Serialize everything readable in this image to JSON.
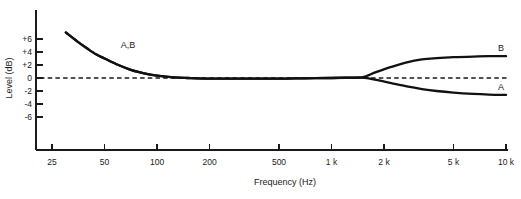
{
  "chart_data": {
    "type": "line",
    "title": "",
    "xlabel": "Frequency (Hz)",
    "ylabel": "Level (dB)",
    "xscale": "log",
    "xlim": [
      25,
      10000
    ],
    "ylim": [
      -7,
      7.5
    ],
    "grid": false,
    "legend": "inline-annotations",
    "xticks": [
      {
        "value": 25,
        "label": "25"
      },
      {
        "value": 50,
        "label": "50"
      },
      {
        "value": 100,
        "label": "100"
      },
      {
        "value": 200,
        "label": "200"
      },
      {
        "value": 500,
        "label": "500"
      },
      {
        "value": 1000,
        "label": "1 k"
      },
      {
        "value": 2000,
        "label": "2 k"
      },
      {
        "value": 5000,
        "label": "5 k"
      },
      {
        "value": 10000,
        "label": "10 k"
      }
    ],
    "yticks": [
      {
        "value": 6,
        "label": "+6"
      },
      {
        "value": 4,
        "label": "+4"
      },
      {
        "value": 2,
        "label": "+2"
      },
      {
        "value": 0,
        "label": "0"
      },
      {
        "value": -2,
        "label": "-2"
      },
      {
        "value": -4,
        "label": "-4"
      },
      {
        "value": -6,
        "label": "-6"
      }
    ],
    "reference_line": {
      "value": 0,
      "style": "dashed",
      "label": "0 dB reference"
    },
    "annotations": [
      {
        "text": "A,B",
        "x": 62,
        "y": 4.6,
        "note": "shared low-frequency boost region"
      },
      {
        "text": "B",
        "x": 9000,
        "y": 4.1,
        "note": "curve B high-frequency boost"
      },
      {
        "text": "A",
        "x": 9000,
        "y": -1.9,
        "note": "curve A high-frequency cut"
      }
    ],
    "series": [
      {
        "name": "A",
        "points": [
          [
            30,
            7.0
          ],
          [
            35,
            5.6
          ],
          [
            40,
            4.5
          ],
          [
            45,
            3.6
          ],
          [
            50,
            3.0
          ],
          [
            60,
            2.0
          ],
          [
            70,
            1.3
          ],
          [
            80,
            0.85
          ],
          [
            90,
            0.55
          ],
          [
            100,
            0.35
          ],
          [
            125,
            0.1
          ],
          [
            150,
            0.0
          ],
          [
            200,
            -0.1
          ],
          [
            300,
            -0.1
          ],
          [
            500,
            -0.1
          ],
          [
            700,
            -0.05
          ],
          [
            1000,
            0.0
          ],
          [
            1250,
            0.05
          ],
          [
            1500,
            0.05
          ],
          [
            1800,
            -0.3
          ],
          [
            2200,
            -0.8
          ],
          [
            2700,
            -1.3
          ],
          [
            3300,
            -1.7
          ],
          [
            4000,
            -2.0
          ],
          [
            5000,
            -2.25
          ],
          [
            6500,
            -2.45
          ],
          [
            8000,
            -2.55
          ],
          [
            10000,
            -2.6
          ]
        ]
      },
      {
        "name": "B",
        "points": [
          [
            30,
            7.0
          ],
          [
            35,
            5.6
          ],
          [
            40,
            4.5
          ],
          [
            45,
            3.6
          ],
          [
            50,
            3.0
          ],
          [
            60,
            2.0
          ],
          [
            70,
            1.3
          ],
          [
            80,
            0.85
          ],
          [
            90,
            0.55
          ],
          [
            100,
            0.35
          ],
          [
            125,
            0.1
          ],
          [
            150,
            0.0
          ],
          [
            200,
            -0.1
          ],
          [
            300,
            -0.1
          ],
          [
            500,
            -0.1
          ],
          [
            700,
            -0.05
          ],
          [
            1000,
            0.0
          ],
          [
            1250,
            0.05
          ],
          [
            1500,
            0.1
          ],
          [
            1800,
            0.9
          ],
          [
            2200,
            1.7
          ],
          [
            2700,
            2.4
          ],
          [
            3300,
            2.85
          ],
          [
            4000,
            3.05
          ],
          [
            5000,
            3.2
          ],
          [
            6500,
            3.3
          ],
          [
            8000,
            3.35
          ],
          [
            10000,
            3.35
          ]
        ]
      }
    ]
  }
}
